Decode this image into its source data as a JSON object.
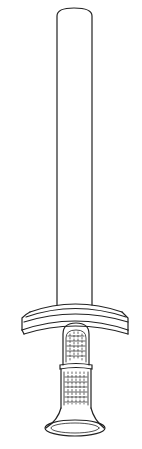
{
  "figure": {
    "parts": [
      "blade",
      "crossguard",
      "grip",
      "pommel"
    ],
    "stroke_color": "#222222",
    "background": "#ffffff"
  },
  "caption": {
    "text": ""
  }
}
